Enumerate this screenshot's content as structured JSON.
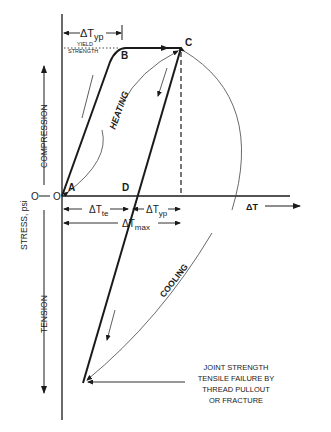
{
  "diagram": {
    "axes": {
      "y_label": "STRESS, psi",
      "y_zero": "O",
      "x_label": "ΔT",
      "compression_label": "COMPRESSION",
      "tension_label": "TENSION"
    },
    "points": {
      "origin": "O",
      "a": "A",
      "b": "B",
      "c": "C",
      "d": "D"
    },
    "dimensions": {
      "dt_yp_top": "ΔT",
      "dt_yp_top_sub": "yp",
      "dt_te": "ΔT",
      "dt_te_sub": "te",
      "dt_yp_mid": "ΔT",
      "dt_yp_mid_sub": "yp",
      "dt_max": "ΔT",
      "dt_max_sub": "max"
    },
    "annotations": {
      "yield_line1": "YIELD",
      "yield_line2": "STRENGTH",
      "heating": "HEATING",
      "cooling": "COOLING",
      "failure": [
        "JOINT STRENGTH",
        "TENSILE FAILURE BY",
        "THREAD PULLOUT",
        "OR FRACTURE"
      ]
    },
    "colors": {
      "ink": "#1a1a1a",
      "background": "#ffffff"
    }
  }
}
